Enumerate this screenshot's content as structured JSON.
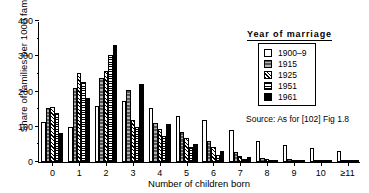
{
  "chart_data": {
    "type": "bar",
    "title": "",
    "xlabel": "Number of children born",
    "ylabel": "Share of families per 1000 families",
    "ylim": [
      0,
      400
    ],
    "yticks": [
      0,
      100,
      200,
      300,
      400
    ],
    "grid": false,
    "legend_position": "top-right",
    "legend_title": "Year of marriage",
    "categories": [
      "0",
      "1",
      "2",
      "3",
      "4",
      "5",
      "6",
      "7",
      "8",
      "9",
      "10",
      "≥11"
    ],
    "series": [
      {
        "name": "1900–9",
        "pattern": "open-white",
        "values": [
          113,
          100,
          160,
          172,
          152,
          130,
          118,
          92,
          60,
          48,
          40,
          30
        ]
      },
      {
        "name": "1915",
        "pattern": "dark-stipple",
        "values": [
          152,
          210,
          238,
          205,
          112,
          86,
          60,
          28,
          12,
          8,
          6,
          4
        ]
      },
      {
        "name": "1925",
        "pattern": "diagonal-hatch",
        "values": [
          157,
          252,
          258,
          118,
          95,
          68,
          42,
          18,
          8,
          5,
          4,
          2
        ]
      },
      {
        "name": "1951",
        "pattern": "horizontal-lines",
        "values": [
          140,
          228,
          305,
          98,
          75,
          42,
          20,
          8,
          4,
          3,
          2,
          1
        ]
      },
      {
        "name": "1961",
        "pattern": "solid-black",
        "values": [
          82,
          182,
          333,
          222,
          108,
          52,
          30,
          14,
          6,
          4,
          3,
          2
        ]
      }
    ],
    "annotations": {
      "source": "Source: As for [102] Fig 1.8"
    }
  },
  "legend": {
    "title": "Year of marriage",
    "items": [
      {
        "label": "1900–9",
        "pattern_class": "p0"
      },
      {
        "label": "1915",
        "pattern_class": "p1"
      },
      {
        "label": "1925",
        "pattern_class": "p2"
      },
      {
        "label": "1951",
        "pattern_class": "p3"
      },
      {
        "label": "1961",
        "pattern_class": "p4"
      }
    ]
  }
}
